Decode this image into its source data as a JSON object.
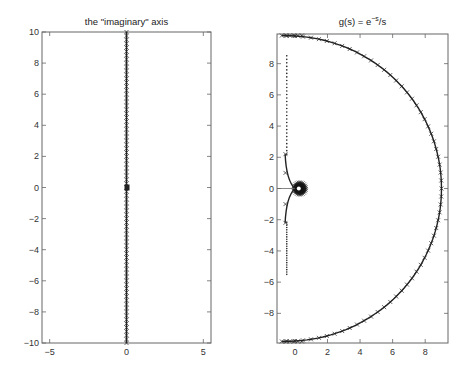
{
  "chart_data": [
    {
      "type": "scatter",
      "title": "the \"imaginary\" axis",
      "xlabel": "",
      "ylabel": "",
      "xlim": [
        -5.5,
        5.5
      ],
      "ylim": [
        -10,
        10
      ],
      "xticks": [
        -5,
        0,
        5
      ],
      "xtick_labels": [
        "-5",
        "0",
        "5"
      ],
      "yticks": [
        -10,
        -8,
        -6,
        -4,
        -2,
        0,
        2,
        4,
        6,
        8,
        10
      ],
      "ytick_labels": [
        "-10",
        "-8",
        "-6",
        "-4",
        "-2",
        "0",
        "2",
        "4",
        "6",
        "8",
        "10"
      ],
      "grid": false,
      "series": [
        {
          "name": "imaginary axis samples (x markers)",
          "description": "points s = j*w along the imaginary axis, w from -10 to 10, dense x-markers, with a small cluster near origin",
          "x_constant": 0,
          "y_range": [
            -10,
            10
          ],
          "marker": "x",
          "count": 80
        }
      ]
    },
    {
      "type": "line",
      "title": "g(s) = e^-s/s",
      "title_display": {
        "base": "g(s) = e",
        "sup": "−s",
        "tail": "/s"
      },
      "xlabel": "",
      "ylabel": "",
      "xlim": [
        -1.1,
        9.4
      ],
      "ylim": [
        -9.9,
        9.9
      ],
      "xticks": [
        0,
        2,
        4,
        6,
        8
      ],
      "xtick_labels": [
        "0",
        "2",
        "4",
        "6",
        "8"
      ],
      "yticks": [
        -8,
        -6,
        -4,
        -2,
        0,
        2,
        4,
        6,
        8
      ],
      "ytick_labels": [
        "-8",
        "-6",
        "-4",
        "-2",
        "0",
        "2",
        "4",
        "6",
        "8"
      ],
      "grid": false,
      "series": [
        {
          "name": "image of large semicircle (x markers)",
          "description": "half-circle arc from about (-0.7, 9.8) through (9, 0) to (-0.7, -9.8), center near (-0.5, 0), radius about 9.5",
          "center": [
            -0.5,
            0
          ],
          "radius": 9.5,
          "marker": "x"
        },
        {
          "name": "image of imaginary axis (dots)",
          "description": "points along x about -0.5 from y 8.5 down to 2.2 and from -2.2 down to -5.5, converging curves to the origin loop",
          "x_approx": -0.5,
          "y_upper_range": [
            2.2,
            8.5
          ],
          "y_lower_range": [
            -5.5,
            -2.2
          ],
          "marker": "."
        },
        {
          "name": "inner curves near origin",
          "description": "two curves from (-0.6, ±2.2) bending to (0, 0), plus a dense small circle of markers centered near (0.3, 0) radius about 0.5",
          "loop_center": [
            0.3,
            0
          ],
          "loop_radius": 0.5
        }
      ]
    }
  ]
}
